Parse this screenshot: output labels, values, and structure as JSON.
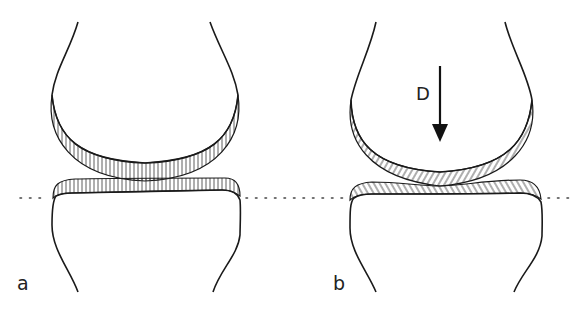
{
  "figure": {
    "panels": [
      {
        "id": "a",
        "label": "a",
        "state": "unloaded joint"
      },
      {
        "id": "b",
        "label": "b",
        "state": "loaded joint",
        "force_label": "D",
        "force_direction": "down"
      }
    ],
    "reference_line": "dotted horizontal line",
    "colors": {
      "ink": "#1a1a1a",
      "background": "#ffffff"
    }
  }
}
